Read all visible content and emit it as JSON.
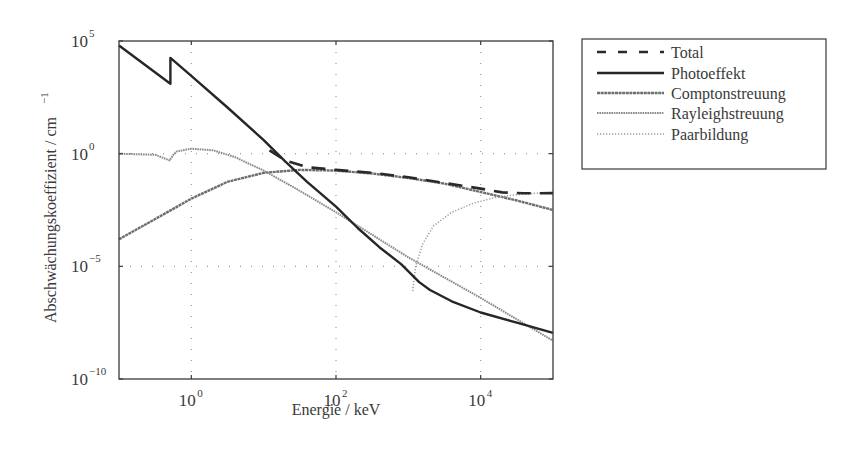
{
  "chart_data": {
    "type": "line",
    "title": "",
    "xlabel": "Energie / keV",
    "ylabel": "Abschwächungskoeffizient / cm^-1",
    "xscale": "log",
    "yscale": "log",
    "xlim": [
      0.1,
      100000
    ],
    "ylim": [
      1e-10,
      100000
    ],
    "grid": true,
    "legend_position": "outside-right-top",
    "x_ticks": [
      {
        "base": "10",
        "exp": "0",
        "value": 1
      },
      {
        "base": "10",
        "exp": "2",
        "value": 100
      },
      {
        "base": "10",
        "exp": "4",
        "value": 10000
      }
    ],
    "y_ticks": [
      {
        "base": "10",
        "exp": "5",
        "value": 100000
      },
      {
        "base": "10",
        "exp": "0",
        "value": 1
      },
      {
        "base": "10",
        "exp": "−5",
        "value": 1e-05
      },
      {
        "base": "10",
        "exp": "−10",
        "value": 1e-10
      }
    ],
    "series": [
      {
        "name": "Total",
        "style": "dashed",
        "color": "#2a2a2a",
        "width": 2.6,
        "log10_x": [
          1.08,
          1.3,
          1.6,
          2.0,
          2.5,
          3.0,
          3.5,
          4.0,
          4.3,
          4.6,
          5.0
        ],
        "log10_y": [
          0.15,
          -0.3,
          -0.6,
          -0.72,
          -0.85,
          -1.05,
          -1.3,
          -1.55,
          -1.72,
          -1.76,
          -1.75
        ]
      },
      {
        "name": "Photoeffekt",
        "style": "solid",
        "color": "#262626",
        "width": 2.4,
        "log10_x": [
          -1.0,
          -0.29,
          -0.29,
          0.0,
          0.5,
          1.0,
          1.3,
          1.6,
          2.0,
          2.3,
          2.6,
          2.9,
          3.15,
          3.3,
          3.6,
          4.0,
          4.5,
          5.0
        ],
        "log10_y": [
          4.8,
          3.1,
          4.25,
          3.45,
          2.05,
          0.6,
          -0.35,
          -1.25,
          -2.35,
          -3.3,
          -4.15,
          -4.9,
          -5.7,
          -6.05,
          -6.55,
          -7.05,
          -7.5,
          -7.95
        ]
      },
      {
        "name": "Comptonstreuung",
        "style": "solid-textured",
        "color": "#6e6e6e",
        "width": 2.4,
        "log10_x": [
          -1.0,
          -0.5,
          0.0,
          0.5,
          1.0,
          1.5,
          2.0,
          2.5,
          3.0,
          3.5,
          4.0,
          4.5,
          5.0
        ],
        "log10_y": [
          -3.8,
          -2.9,
          -2.0,
          -1.25,
          -0.85,
          -0.72,
          -0.75,
          -0.88,
          -1.08,
          -1.33,
          -1.7,
          -2.08,
          -2.5
        ]
      },
      {
        "name": "Rayleighstreuung",
        "style": "dotted-dense",
        "color": "#8a8a8a",
        "width": 2.0,
        "log10_x": [
          -1.0,
          -0.5,
          -0.3,
          -0.25,
          -0.2,
          0.0,
          0.3,
          0.6,
          1.0,
          1.5,
          2.0,
          2.5,
          3.0,
          3.5,
          4.0,
          4.5,
          5.0
        ],
        "log10_y": [
          0.0,
          -0.05,
          -0.3,
          -0.05,
          0.1,
          0.22,
          0.15,
          -0.15,
          -0.75,
          -1.65,
          -2.6,
          -3.6,
          -4.6,
          -5.5,
          -6.4,
          -7.35,
          -8.3
        ]
      },
      {
        "name": "Paarbildung",
        "style": "dotted-sparse",
        "color": "#9a9a9a",
        "width": 1.5,
        "log10_x": [
          3.06,
          3.1,
          3.2,
          3.35,
          3.6,
          3.9,
          4.2,
          4.5,
          4.8,
          5.0
        ],
        "log10_y": [
          -6.1,
          -5.0,
          -4.0,
          -3.2,
          -2.6,
          -2.2,
          -1.95,
          -1.82,
          -1.75,
          -1.72
        ]
      }
    ]
  },
  "legend": {
    "items": [
      {
        "label": "Total"
      },
      {
        "label": "Photoeffekt"
      },
      {
        "label": "Comptonstreuung"
      },
      {
        "label": "Rayleighstreuung"
      },
      {
        "label": "Paarbildung"
      }
    ]
  },
  "axes": {
    "xlabel": "Energie / keV",
    "ylabel_main": "Abschwächungskoeffizient / cm",
    "ylabel_exp": "−1"
  }
}
